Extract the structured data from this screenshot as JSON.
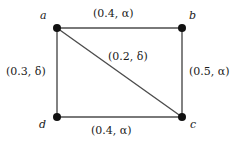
{
  "figure": {
    "type": "undirected-weighted-graph",
    "background_color": "#ffffff",
    "edge_color": "#4d4d4d",
    "node_color": "#111111"
  },
  "nodes": [
    {
      "id": "a",
      "label": "a",
      "x": 57,
      "y": 28
    },
    {
      "id": "b",
      "label": "b",
      "x": 182,
      "y": 28
    },
    {
      "id": "c",
      "label": "c",
      "x": 182,
      "y": 117
    },
    {
      "id": "d",
      "label": "d",
      "x": 57,
      "y": 117
    }
  ],
  "edges": [
    {
      "id": "ab",
      "from": "a",
      "to": "b",
      "label": "(0.4, α)",
      "weight": "0.4",
      "symbol": "α"
    },
    {
      "id": "ad",
      "from": "a",
      "to": "d",
      "label": "(0.3, δ)",
      "weight": "0.3",
      "symbol": "δ"
    },
    {
      "id": "bc",
      "from": "b",
      "to": "c",
      "label": "(0.5, α)",
      "weight": "0.5",
      "symbol": "α"
    },
    {
      "id": "dc",
      "from": "d",
      "to": "c",
      "label": "(0.4, α)",
      "weight": "0.4",
      "symbol": "α"
    },
    {
      "id": "ac",
      "from": "a",
      "to": "c",
      "label": "(0.2, δ)",
      "weight": "0.2",
      "symbol": "δ"
    }
  ]
}
